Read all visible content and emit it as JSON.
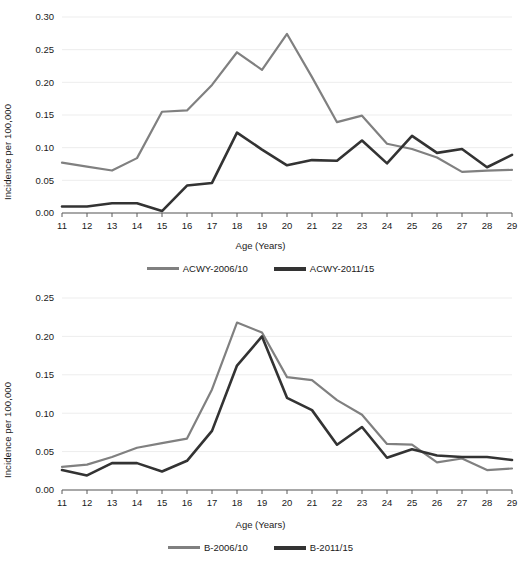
{
  "figure": {
    "axis_title_x": "Age (Years)",
    "axis_title_y": "Incidence per 100,000",
    "caption": ""
  },
  "chart_data": [
    {
      "id": "acwy",
      "type": "line",
      "title": "",
      "xlabel": "Age (Years)",
      "ylabel": "Incidence per 100,000",
      "xlim": [
        11,
        29
      ],
      "ylim": [
        0.0,
        0.3
      ],
      "yticks": [
        "0.00",
        "0.05",
        "0.10",
        "0.15",
        "0.20",
        "0.25",
        "0.30"
      ],
      "ytick_values": [
        0.0,
        0.05,
        0.1,
        0.15,
        0.2,
        0.25,
        0.3
      ],
      "grid": true,
      "legend_position": "bottom",
      "x": [
        11,
        12,
        13,
        14,
        15,
        16,
        17,
        18,
        19,
        20,
        21,
        22,
        23,
        24,
        25,
        26,
        27,
        28,
        29
      ],
      "categories": [
        "11",
        "12",
        "13",
        "14",
        "15",
        "16",
        "17",
        "18",
        "19",
        "20",
        "21",
        "22",
        "23",
        "24",
        "25",
        "26",
        "27",
        "28",
        "29"
      ],
      "series": [
        {
          "name": "ACWY-2006/10",
          "color": "#808080",
          "width": 2.2,
          "values": [
            0.077,
            0.071,
            0.065,
            0.084,
            0.155,
            0.157,
            0.196,
            0.246,
            0.219,
            0.274,
            0.208,
            0.139,
            0.149,
            0.106,
            0.098,
            0.085,
            0.063,
            0.065,
            0.066
          ]
        },
        {
          "name": "ACWY-2011/15",
          "color": "#333333",
          "width": 2.6,
          "values": [
            0.01,
            0.01,
            0.015,
            0.015,
            0.003,
            0.042,
            0.046,
            0.123,
            0.097,
            0.073,
            0.081,
            0.08,
            0.111,
            0.076,
            0.118,
            0.092,
            0.098,
            0.07,
            0.089
          ]
        }
      ]
    },
    {
      "id": "b",
      "type": "line",
      "title": "",
      "xlabel": "Age (Years)",
      "ylabel": "Incidence per 100,000",
      "xlim": [
        11,
        29
      ],
      "ylim": [
        0.0,
        0.25
      ],
      "yticks": [
        "0.00",
        "0.05",
        "0.10",
        "0.15",
        "0.20",
        "0.25"
      ],
      "ytick_values": [
        0.0,
        0.05,
        0.1,
        0.15,
        0.2,
        0.25
      ],
      "grid": true,
      "legend_position": "bottom",
      "x": [
        11,
        12,
        13,
        14,
        15,
        16,
        17,
        18,
        19,
        20,
        21,
        22,
        23,
        24,
        25,
        26,
        27,
        28,
        29
      ],
      "categories": [
        "11",
        "12",
        "13",
        "14",
        "15",
        "16",
        "17",
        "18",
        "19",
        "20",
        "21",
        "22",
        "23",
        "24",
        "25",
        "26",
        "27",
        "28",
        "29"
      ],
      "series": [
        {
          "name": "B-2006/10",
          "color": "#808080",
          "width": 2.2,
          "values": [
            0.03,
            0.033,
            0.043,
            0.055,
            0.061,
            0.067,
            0.131,
            0.218,
            0.205,
            0.147,
            0.143,
            0.117,
            0.098,
            0.06,
            0.059,
            0.036,
            0.041,
            0.026,
            0.028
          ]
        },
        {
          "name": "B-2011/15",
          "color": "#333333",
          "width": 2.6,
          "values": [
            0.026,
            0.019,
            0.035,
            0.035,
            0.024,
            0.038,
            0.077,
            0.162,
            0.2,
            0.12,
            0.104,
            0.059,
            0.082,
            0.042,
            0.053,
            0.045,
            0.043,
            0.043,
            0.039
          ]
        }
      ]
    }
  ],
  "panels": {
    "acwy": {
      "legend": [
        {
          "label": "ACWY-2006/10",
          "swatch": "s1"
        },
        {
          "label": "ACWY-2011/15",
          "swatch": "s2"
        }
      ]
    },
    "b": {
      "legend": [
        {
          "label": "B-2006/10",
          "swatch": "s1"
        },
        {
          "label": "B-2011/15",
          "swatch": "s2"
        }
      ]
    }
  }
}
